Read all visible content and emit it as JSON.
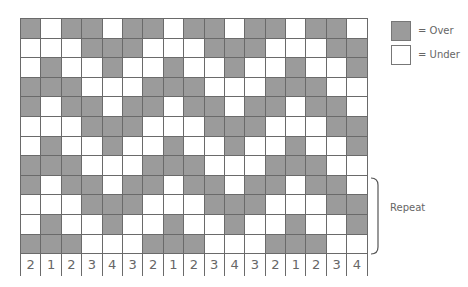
{
  "colors": {
    "over": "#9b9b9b",
    "under": "#ffffff",
    "line": "#6a6a6a"
  },
  "legend": [
    {
      "label": "= Over",
      "key": "G"
    },
    {
      "label": "= Under",
      "key": "W"
    }
  ],
  "grid": {
    "columns": 17,
    "rows": [
      "GWGGWGGWGGWGGWGGW",
      "WWWGGGWWWGGGWWWGG",
      "WGWWGWWGWWGWWGWWG",
      "GGGWWWGGGWWWGGGWW",
      "GWGGWGGWGGWGGWGGW",
      "WWWGGGWWWGGGWWWGG",
      "WGWWGWWGWWGWWGWWG",
      "GGGWWWGGGWWWGGGWW",
      "GWGGWGGWGGWGGWGGW",
      "WWWGGGWWWGGGWWWGG",
      "WGWWGWWGWWGWWGWWG",
      "GGGWWWGGGWWWGGGWW"
    ]
  },
  "column_numbers": [
    "2",
    "1",
    "2",
    "3",
    "4",
    "3",
    "2",
    "1",
    "2",
    "3",
    "4",
    "3",
    "2",
    "1",
    "2",
    "3",
    "4"
  ],
  "repeat": {
    "label": "Repeat",
    "rows_from": 9,
    "rows_to": 12
  }
}
